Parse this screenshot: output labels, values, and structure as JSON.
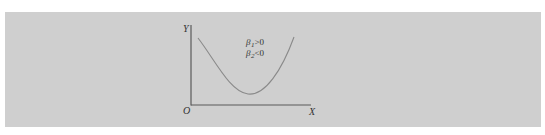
{
  "figure": {
    "background_color": "#cfcfcf",
    "axis_color": "#5a5a5a",
    "curve_color": "#8a8a8a",
    "y_axis_label": "Y",
    "x_axis_label": "X",
    "origin_label": "O",
    "annotations": [
      {
        "symbol": "β",
        "subscript": "1",
        "relation": ">0"
      },
      {
        "symbol": "β",
        "subscript": "2",
        "relation": "<0"
      }
    ],
    "curve_description": "U-shaped (convex) curve with a minimum, starting high on the left, dipping, then rising on the right"
  }
}
